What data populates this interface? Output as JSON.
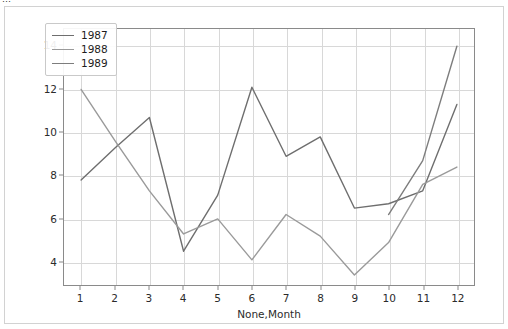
{
  "window": {
    "clipped_top_text": "…"
  },
  "chart_data": {
    "type": "line",
    "title": "",
    "xlabel": "None,Month",
    "ylabel": "",
    "x": [
      1,
      2,
      3,
      4,
      5,
      6,
      7,
      8,
      9,
      10,
      11,
      12
    ],
    "xticks": [
      "1",
      "2",
      "3",
      "4",
      "5",
      "6",
      "7",
      "8",
      "9",
      "10",
      "11",
      "12"
    ],
    "yticks": [
      "4",
      "6",
      "8",
      "10",
      "12",
      "14"
    ],
    "xlim": [
      0.5,
      12.5
    ],
    "ylim": [
      2.9,
      14.8
    ],
    "grid": true,
    "legend_position": "upper left",
    "series": [
      {
        "name": "1987",
        "color": "#6e6e6e",
        "x": [
          1,
          2,
          3,
          4,
          5,
          6,
          7,
          8,
          9,
          10,
          11,
          12
        ],
        "values": [
          7.8,
          9.3,
          10.7,
          4.5,
          7.1,
          12.1,
          8.9,
          9.8,
          6.5,
          6.7,
          7.3,
          11.3
        ]
      },
      {
        "name": "1988",
        "color": "#9a9a9a",
        "x": [
          1,
          2,
          3,
          4,
          5,
          6,
          7,
          8,
          9,
          10,
          11,
          12
        ],
        "values": [
          12.0,
          9.6,
          7.3,
          5.3,
          6.0,
          4.1,
          6.2,
          5.2,
          3.4,
          4.9,
          7.6,
          8.4
        ]
      },
      {
        "name": "1989",
        "color": "#7d7d7d",
        "x": [
          10,
          11,
          12
        ],
        "values": [
          6.2,
          8.7,
          14.0
        ]
      }
    ]
  },
  "legend": {
    "items": [
      {
        "label": "1987",
        "color": "#6e6e6e"
      },
      {
        "label": "1988",
        "color": "#9a9a9a"
      },
      {
        "label": "1989",
        "color": "#7d7d7d"
      }
    ]
  }
}
